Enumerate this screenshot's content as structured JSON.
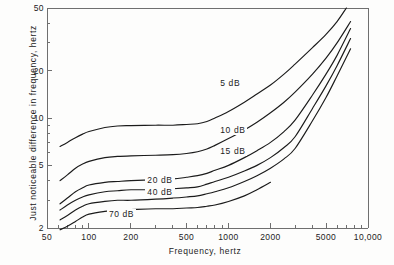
{
  "chart_data": {
    "type": "line",
    "title": "",
    "xlabel": "Frequency, hertz",
    "ylabel": "Just noticeable difference in frequency, hertz",
    "xscale": "log",
    "yscale": "log",
    "xlim": [
      50,
      10000
    ],
    "ylim": [
      2,
      50
    ],
    "grid": false,
    "legend_position": "inline-labels",
    "xticks": [
      {
        "value": 50,
        "label": "50"
      },
      {
        "value": 100,
        "label": "100"
      },
      {
        "value": 200,
        "label": "200"
      },
      {
        "value": 500,
        "label": "500"
      },
      {
        "value": 1000,
        "label": "1000"
      },
      {
        "value": 2000,
        "label": "2000"
      },
      {
        "value": 5000,
        "label": "5000"
      },
      {
        "value": 10000,
        "label": "10,000"
      }
    ],
    "xminor_ticks": [
      60,
      70,
      80,
      90,
      300,
      400,
      600,
      700,
      800,
      900,
      3000,
      4000,
      6000,
      7000,
      8000,
      9000
    ],
    "yticks": [
      {
        "value": 2,
        "label": "2"
      },
      {
        "value": 5,
        "label": "5"
      },
      {
        "value": 10,
        "label": "10"
      },
      {
        "value": 20,
        "label": "20"
      },
      {
        "value": 50,
        "label": "50"
      }
    ],
    "yminor_ticks": [
      3,
      4,
      6,
      7,
      8,
      9,
      30,
      40
    ],
    "series": [
      {
        "name": "5 dB",
        "label": "5 dB",
        "label_x": 1100,
        "label_y": 16.5,
        "points": [
          [
            62,
            6.6
          ],
          [
            70,
            7.0
          ],
          [
            80,
            7.5
          ],
          [
            90,
            7.9
          ],
          [
            100,
            8.2
          ],
          [
            130,
            8.7
          ],
          [
            160,
            8.9
          ],
          [
            200,
            8.95
          ],
          [
            300,
            9.0
          ],
          [
            400,
            9.0
          ],
          [
            500,
            9.1
          ],
          [
            600,
            9.2
          ],
          [
            700,
            9.5
          ],
          [
            800,
            10.0
          ],
          [
            1000,
            11.0
          ],
          [
            1300,
            12.6
          ],
          [
            1600,
            14.2
          ],
          [
            2000,
            16.2
          ],
          [
            2500,
            19.0
          ],
          [
            3000,
            22.0
          ],
          [
            4000,
            28.0
          ],
          [
            5000,
            34.0
          ],
          [
            6000,
            41.0
          ],
          [
            7000,
            50.0
          ]
        ]
      },
      {
        "name": "10 dB",
        "label": "10 dB",
        "label_x": 1100,
        "label_y": 8.3,
        "points": [
          [
            62,
            4.0
          ],
          [
            70,
            4.35
          ],
          [
            80,
            4.8
          ],
          [
            90,
            5.1
          ],
          [
            100,
            5.3
          ],
          [
            130,
            5.6
          ],
          [
            160,
            5.7
          ],
          [
            200,
            5.75
          ],
          [
            300,
            5.8
          ],
          [
            400,
            5.85
          ],
          [
            500,
            5.95
          ],
          [
            600,
            6.1
          ],
          [
            700,
            6.35
          ],
          [
            800,
            6.7
          ],
          [
            1000,
            7.4
          ],
          [
            1300,
            8.4
          ],
          [
            1600,
            9.4
          ],
          [
            2000,
            10.8
          ],
          [
            2500,
            12.6
          ],
          [
            3000,
            14.6
          ],
          [
            4000,
            19.0
          ],
          [
            5000,
            24.0
          ],
          [
            6000,
            30.0
          ],
          [
            7500,
            41.0
          ]
        ]
      },
      {
        "name": "15 dB",
        "label": "15 dB",
        "label_x": 1100,
        "label_y": 6.1,
        "points": [
          [
            62,
            2.85
          ],
          [
            70,
            3.1
          ],
          [
            80,
            3.4
          ],
          [
            90,
            3.6
          ],
          [
            100,
            3.75
          ],
          [
            130,
            3.9
          ],
          [
            160,
            3.95
          ],
          [
            200,
            4.0
          ],
          [
            300,
            4.05
          ],
          [
            400,
            4.1
          ],
          [
            500,
            4.2
          ],
          [
            600,
            4.3
          ],
          [
            700,
            4.45
          ],
          [
            800,
            4.65
          ],
          [
            1000,
            5.0
          ],
          [
            1300,
            5.6
          ],
          [
            1600,
            6.2
          ],
          [
            2000,
            7.0
          ],
          [
            2500,
            8.2
          ],
          [
            3000,
            9.7
          ],
          [
            4000,
            14.0
          ],
          [
            5000,
            19.0
          ],
          [
            6000,
            25.0
          ],
          [
            7500,
            37.0
          ]
        ]
      },
      {
        "name": "20 dB",
        "label": "20 dB",
        "label_x": 330,
        "label_y": 3.95,
        "points": [
          [
            62,
            2.6
          ],
          [
            70,
            2.8
          ],
          [
            80,
            3.0
          ],
          [
            90,
            3.15
          ],
          [
            100,
            3.25
          ],
          [
            130,
            3.4
          ],
          [
            160,
            3.45
          ],
          [
            200,
            3.5
          ],
          [
            300,
            3.5
          ],
          [
            400,
            3.55
          ],
          [
            500,
            3.6
          ],
          [
            600,
            3.65
          ],
          [
            700,
            3.8
          ],
          [
            800,
            3.95
          ],
          [
            1000,
            4.2
          ],
          [
            1300,
            4.6
          ],
          [
            1600,
            5.0
          ],
          [
            2000,
            5.6
          ],
          [
            2500,
            6.5
          ],
          [
            3000,
            7.6
          ],
          [
            4000,
            11.5
          ],
          [
            5000,
            16.0
          ],
          [
            6000,
            21.5
          ],
          [
            7500,
            32.0
          ]
        ]
      },
      {
        "name": "40 dB",
        "label": "40 dB",
        "label_x": 330,
        "label_y": 3.35,
        "points": [
          [
            62,
            2.25
          ],
          [
            70,
            2.4
          ],
          [
            80,
            2.6
          ],
          [
            90,
            2.75
          ],
          [
            100,
            2.85
          ],
          [
            130,
            2.95
          ],
          [
            160,
            3.0
          ],
          [
            200,
            3.0
          ],
          [
            300,
            3.05
          ],
          [
            400,
            3.1
          ],
          [
            500,
            3.15
          ],
          [
            600,
            3.2
          ],
          [
            700,
            3.3
          ],
          [
            800,
            3.4
          ],
          [
            1000,
            3.6
          ],
          [
            1300,
            3.95
          ],
          [
            1600,
            4.3
          ],
          [
            2000,
            4.8
          ],
          [
            2500,
            5.5
          ],
          [
            3000,
            6.4
          ],
          [
            4000,
            9.6
          ],
          [
            5000,
            13.5
          ],
          [
            6000,
            18.5
          ],
          [
            7500,
            27.5
          ]
        ]
      },
      {
        "name": "70 dB",
        "label": "70 dB",
        "label_x": 175,
        "label_y": 2.42,
        "points": [
          [
            62,
            1.95
          ],
          [
            70,
            2.05
          ],
          [
            80,
            2.2
          ],
          [
            90,
            2.35
          ],
          [
            100,
            2.45
          ],
          [
            130,
            2.55
          ],
          [
            160,
            2.6
          ],
          [
            200,
            2.62
          ],
          [
            300,
            2.65
          ],
          [
            400,
            2.65
          ],
          [
            500,
            2.68
          ],
          [
            600,
            2.7
          ],
          [
            700,
            2.75
          ],
          [
            800,
            2.8
          ],
          [
            1000,
            2.95
          ],
          [
            1300,
            3.2
          ],
          [
            1600,
            3.5
          ],
          [
            2000,
            3.9
          ]
        ]
      }
    ]
  },
  "axis": {
    "frame_color": "#6f6f6f",
    "curve_color": "#1b1b1b"
  }
}
